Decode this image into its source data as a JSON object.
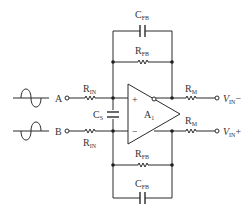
{
  "diagram": {
    "type": "fully-differential op-amp input stage",
    "amplifier": {
      "label": "A",
      "subscript": "1",
      "plus": "+",
      "minus": "−"
    },
    "inputs": [
      {
        "label": "A",
        "resistor": {
          "label": "R",
          "subscript": "IN"
        },
        "waveform": "sine-up-first"
      },
      {
        "label": "B",
        "resistor": {
          "label": "R",
          "subscript": "IN"
        },
        "waveform": "sine-down-first"
      }
    ],
    "shunt_capacitor": {
      "label": "C",
      "subscript": "S"
    },
    "feedback_top": {
      "resistor": {
        "label": "R",
        "subscript": "FB"
      },
      "capacitor": {
        "label": "C",
        "subscript": "FB"
      }
    },
    "feedback_bottom": {
      "resistor": {
        "label": "R",
        "subscript": "FB"
      },
      "capacitor": {
        "label": "C",
        "subscript": "FB"
      }
    },
    "outputs": [
      {
        "resistor": {
          "label": "R",
          "subscript": "M"
        },
        "label": "V",
        "subscript": "IN",
        "suffix": "−"
      },
      {
        "resistor": {
          "label": "R",
          "subscript": "M"
        },
        "label": "V",
        "subscript": "IN",
        "suffix": "+"
      }
    ],
    "colors": {
      "wire": "#2b2b2b",
      "text": "#333333",
      "background": "#ffffff"
    }
  }
}
